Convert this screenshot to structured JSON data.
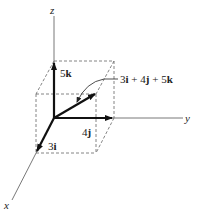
{
  "diagram": {
    "axes": {
      "x_label": "x",
      "y_label": "y",
      "z_label": "z"
    },
    "components": {
      "i": {
        "coef": "3",
        "unit": "i"
      },
      "j": {
        "coef": "4",
        "unit": "j"
      },
      "k": {
        "coef": "5",
        "unit": "k"
      }
    },
    "resultant": {
      "term1": "3",
      "unit1": "i",
      "op1": " + ",
      "term2": "4",
      "unit2": "j",
      "op2": " + ",
      "term3": "5",
      "unit3": "k"
    },
    "colors": {
      "axis": "#555555",
      "vector": "#111111",
      "box": "#666666"
    }
  }
}
